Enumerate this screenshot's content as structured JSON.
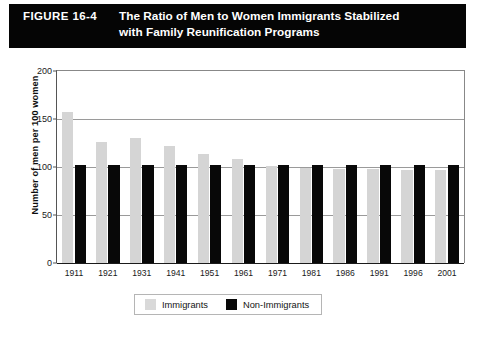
{
  "figure": {
    "number": "FIGURE 16-4",
    "title_line1": "The Ratio of Men to Women Immigrants Stabilized",
    "title_line2": "with Family Reunification Programs"
  },
  "legend": {
    "immigrants_label": "Immigrants",
    "non_immigrants_label": "Non-Immigrants"
  },
  "colors": {
    "immigrants": "#d5d5d5",
    "non_immigrants": "#080808",
    "title_band": "#050505",
    "frame": "#4a4a4a",
    "gridline": "#9a9a9a"
  },
  "chart_data": {
    "type": "bar",
    "title": "The Ratio of Men to Women Immigrants Stabilized with Family Reunification Programs",
    "xlabel": "",
    "ylabel": "Number of men per 100 women",
    "ylim": [
      0,
      200
    ],
    "yticks": [
      0,
      50,
      100,
      150,
      200
    ],
    "grid": true,
    "legend_position": "bottom-center",
    "categories": [
      "1911",
      "1921",
      "1931",
      "1941",
      "1951",
      "1961",
      "1971",
      "1981",
      "1986",
      "1991",
      "1996",
      "2001"
    ],
    "series": [
      {
        "name": "Immigrants",
        "color": "#d5d5d5",
        "values": [
          157,
          126,
          130,
          122,
          114,
          108,
          101,
          99,
          98,
          98,
          97,
          97
        ]
      },
      {
        "name": "Non-Immigrants",
        "color": "#080808",
        "values": [
          102,
          102,
          102,
          102,
          102,
          102,
          102,
          102,
          102,
          102,
          102,
          102
        ]
      }
    ]
  }
}
